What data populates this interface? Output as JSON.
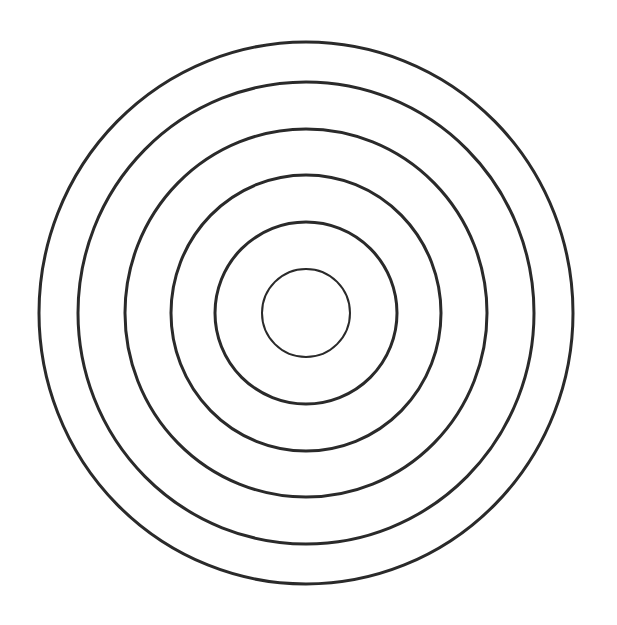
{
  "figure": {
    "center": {
      "x": 306,
      "y": 313
    },
    "stroke_color": "#2a2a2a",
    "background": "#ffffff",
    "rings": [
      {
        "rx": 267,
        "ry": 271,
        "stroke_width": 3
      },
      {
        "rx": 228,
        "ry": 231,
        "stroke_width": 3
      },
      {
        "rx": 181,
        "ry": 184,
        "stroke_width": 3
      },
      {
        "rx": 135,
        "ry": 138,
        "stroke_width": 3
      },
      {
        "rx": 91,
        "ry": 91,
        "stroke_width": 3
      },
      {
        "rx": 44,
        "ry": 44,
        "stroke_width": 2
      }
    ]
  }
}
